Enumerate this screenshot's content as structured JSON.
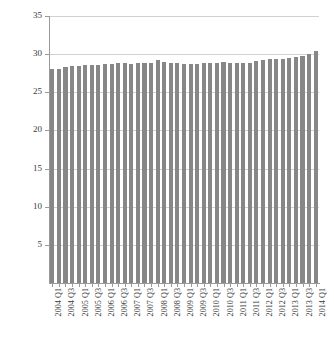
{
  "chart_data": {
    "type": "bar",
    "title": "",
    "subtitle": "",
    "xlabel": "",
    "ylabel": "numbers in employment (millions)",
    "ylim": [
      0,
      35
    ],
    "ytick_labels": [
      "5",
      "10",
      "15",
      "20",
      "25",
      "30",
      "35"
    ],
    "yticks": [
      5,
      10,
      15,
      20,
      25,
      30,
      35
    ],
    "grid": true,
    "legend": "none",
    "bar_color": "#878787",
    "gridline_color": "#d2d2d2",
    "axis_color": "#9a9a9a",
    "categories": [
      "2004 Q1",
      "2004 Q2",
      "2004 Q3",
      "2004 Q4",
      "2005 Q1",
      "2005 Q2",
      "2005 Q3",
      "2005 Q4",
      "2006 Q1",
      "2006 Q2",
      "2006 Q3",
      "2006 Q4",
      "2007 Q1",
      "2007 Q2",
      "2007 Q3",
      "2007 Q4",
      "2008 Q1",
      "2008 Q2",
      "2008 Q3",
      "2008 Q4",
      "2009 Q1",
      "2009 Q2",
      "2009 Q3",
      "2009 Q4",
      "2010 Q1",
      "2010 Q2",
      "2010 Q3",
      "2010 Q4",
      "2011 Q1",
      "2011 Q2",
      "2011 Q3",
      "2011 Q4",
      "2012 Q1",
      "2012 Q2",
      "2012 Q3",
      "2012 Q4",
      "2013 Q1",
      "2013 Q2",
      "2013 Q3",
      "2013 Q4",
      "2014 Q1"
    ],
    "tick_labels_shown": [
      "2004 Q1",
      "",
      "2004 Q3",
      "",
      "2005 Q1",
      "",
      "2005 Q3",
      "",
      "2006 Q1",
      "",
      "2006 Q3",
      "",
      "2007 Q1",
      "",
      "2007 Q3",
      "",
      "2008 Q1",
      "",
      "2008 Q3",
      "",
      "2009 Q1",
      "",
      "2009 Q3",
      "",
      "2010 Q1",
      "",
      "2010 Q3",
      "",
      "2011 Q1",
      "",
      "2011 Q3",
      "",
      "2012 Q1",
      "",
      "2012 Q3",
      "",
      "2013 Q1",
      "",
      "2013 Q3",
      "",
      "2014 Q1"
    ],
    "values": [
      28.1,
      28.1,
      28.3,
      28.4,
      28.5,
      28.6,
      28.6,
      28.6,
      28.7,
      28.7,
      28.8,
      28.8,
      28.7,
      28.8,
      28.9,
      28.9,
      29.2,
      29.0,
      28.9,
      28.8,
      28.7,
      28.7,
      28.7,
      28.8,
      28.9,
      28.9,
      29.0,
      28.9,
      28.9,
      28.9,
      28.9,
      29.1,
      29.2,
      29.3,
      29.4,
      29.4,
      29.5,
      29.6,
      29.7,
      30.0,
      30.4
    ]
  }
}
